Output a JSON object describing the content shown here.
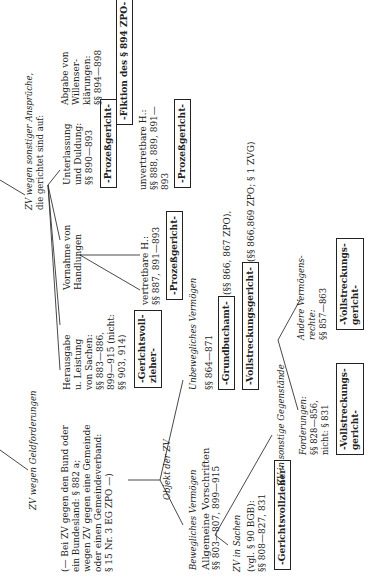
{
  "geld": {
    "heading": "ZV wegen Geldforderungen",
    "note": [
      "(— Bei ZV gegen den Bund oder",
      "ein Bundesland: § 882 a;",
      "wegen ZV gegen eine Gemeinde",
      "oder einen Gemeindeverband:",
      "§ 15 Nr. 3 EG ZPO —)"
    ],
    "objekt": "Objekt der ZV",
    "beweglich": {
      "heading": "Bewegliches Vermögen",
      "allg": [
        "Allgemeine Vorschriften",
        "§§ 803—807, 899—915"
      ],
      "sachen": {
        "heading": "ZV in Sachen",
        "text": [
          "(vgl. § 90 BGB):",
          "§§ 808—827, 831"
        ],
        "organ": "-Gerichtsvollzieher-"
      },
      "sonstige": {
        "heading": "ZV in sonstige Gegenstände",
        "forderungen": [
          "Forderungen:",
          "§§ 828—856,",
          "nicht: § 831"
        ],
        "forderungen_organ": [
          "-Vollstreckungs-",
          "gericht-"
        ],
        "andere": [
          "Andere Vermögens-",
          "rechte:",
          "§§ 857—863"
        ],
        "andere_organ": [
          "-Vollstreckungs-",
          "gericht-"
        ]
      }
    },
    "unbeweglich": {
      "heading": "Unbewegliches Vermögen",
      "paragraphs": "§§ 864—871",
      "organ1": "-Grundbuchamt-",
      "organ1_ref": "(§§ 866, 867 ZPO),",
      "organ2": "-Vollstreckungsgericht-",
      "organ2_ref": "(§§ 866,869 ZPO; § 1 ZVG)"
    }
  },
  "sonstig": {
    "heading": [
      "ZV wegen sonstiger Ansprüche,",
      "die gerichtet sind auf:"
    ],
    "herausgabe": [
      "Herausgabe",
      "u. Leistung",
      "von Sachen:",
      "§§ 883—886,",
      "899—915 (nicht:",
      "§§ 903, 914)"
    ],
    "herausgabe_organ": [
      "-Gerichtsvoll-",
      "zieher-"
    ],
    "vornahme": [
      "Vornahme von",
      "Handlungen"
    ],
    "vertretbar": [
      "vertretbare H.:",
      "§§ 887, 891—893"
    ],
    "vertretbar_organ": "-Prozeßgericht-",
    "unvertretbar": [
      "unvertretbare H.:",
      "§§ 888, 889, 891—",
      "893"
    ],
    "unvertretbar_organ": "-Prozeßgericht-",
    "unterlassung": [
      "Unterlassung",
      "und Duldung:",
      "§§ 890—893"
    ],
    "unterlassung_organ": "-Prozeßgericht-",
    "abgabe": [
      "Abgabe von",
      "Willenser-",
      "klärungen:",
      "§§ 894—898"
    ],
    "abgabe_organ": "-Fiktion des § 894 ZPO-"
  }
}
